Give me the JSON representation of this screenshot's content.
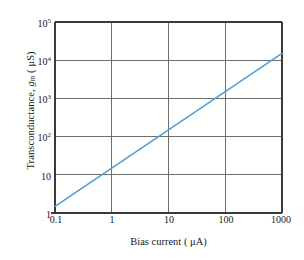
{
  "chart_data": {
    "type": "line",
    "title": "",
    "xlabel": "Bias current ( μA)",
    "ylabel": "Transconductance, g_m ( μS)",
    "ylabel_text": "Transconductance,",
    "ylabel_symbol": "g",
    "ylabel_subscript": "m",
    "ylabel_units": "( μS)",
    "xscale": "log",
    "yscale": "log",
    "xlim": [
      0.1,
      1000
    ],
    "ylim": [
      1,
      100000
    ],
    "grid": true,
    "legend": null,
    "xtick_labels": [
      "0.1",
      "1",
      "10",
      "100",
      "1000"
    ],
    "xtick_values": [
      0.1,
      1,
      10,
      100,
      1000
    ],
    "ytick_labels": [
      "1",
      "10",
      "10^2",
      "10^3",
      "10^4",
      "10^5"
    ],
    "ytick_values": [
      1,
      10,
      100,
      1000,
      10000,
      100000
    ],
    "ytick_mantissa": [
      "1",
      "10",
      "10",
      "10",
      "10",
      "10"
    ],
    "ytick_exponent": [
      "",
      "",
      "2",
      "3",
      "4",
      "5"
    ],
    "series": [
      {
        "name": "gm vs bias current",
        "color": "#4d9ed4",
        "x": [
          0.1,
          1,
          10,
          100,
          1000
        ],
        "y": [
          1.5,
          15,
          150,
          1500,
          15000
        ]
      }
    ],
    "axis_color": "#3a3a3a",
    "grid_color": "#6e6e6e",
    "background": "#ffffff"
  },
  "figure": {
    "plot_left_px": 55,
    "plot_right_px": 282,
    "plot_top_px": 22,
    "plot_bottom_px": 213
  }
}
